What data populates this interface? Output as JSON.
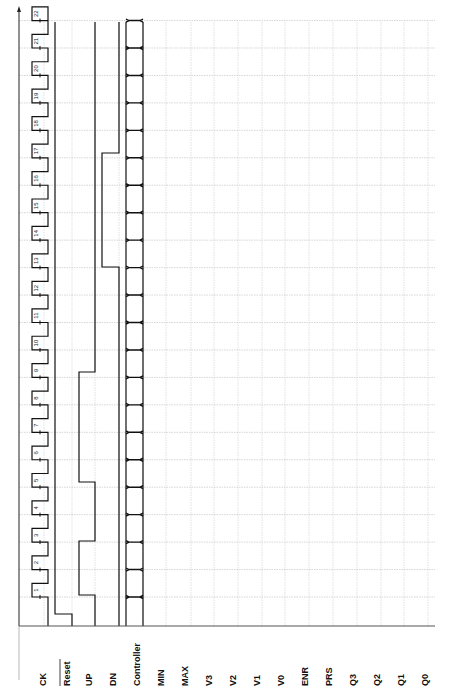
{
  "diagram": {
    "type": "timing-diagram",
    "orientation": "rotated-90-ccw",
    "signals": [
      {
        "name": "CK",
        "overbar": false
      },
      {
        "name": "Reset",
        "overbar": true
      },
      {
        "name": "UP",
        "overbar": false
      },
      {
        "name": "DN",
        "overbar": false
      },
      {
        "name": "Controller",
        "overbar": false
      },
      {
        "name": "MIN",
        "overbar": false
      },
      {
        "name": "MAX",
        "overbar": false
      },
      {
        "name": "V3",
        "overbar": false
      },
      {
        "name": "V2",
        "overbar": false
      },
      {
        "name": "V1",
        "overbar": false
      },
      {
        "name": "V0",
        "overbar": false
      },
      {
        "name": "ENR",
        "overbar": false
      },
      {
        "name": "PRS",
        "overbar": false
      },
      {
        "name": "Q3",
        "overbar": false
      },
      {
        "name": "Q2",
        "overbar": false
      },
      {
        "name": "Q1",
        "overbar": false
      },
      {
        "name": "Q0",
        "overbar": false
      }
    ],
    "clock_cycles": [
      "1",
      "2",
      "3",
      "4",
      "5",
      "6",
      "7",
      "8",
      "9",
      "10",
      "11",
      "12",
      "13",
      "14",
      "15",
      "16",
      "17",
      "18",
      "19",
      "20",
      "21",
      "22"
    ],
    "waveforms": {
      "Reset": "low at start, goes high before cycle 1 and stays high",
      "UP": "pulse high during cycles 1-2 and during cycles 3..9 region (two pulses)",
      "DN": "pulse high from cycle 13 to cycle 17",
      "Controller": "bus value changing every clock cycle"
    },
    "axis_marker": "t"
  }
}
